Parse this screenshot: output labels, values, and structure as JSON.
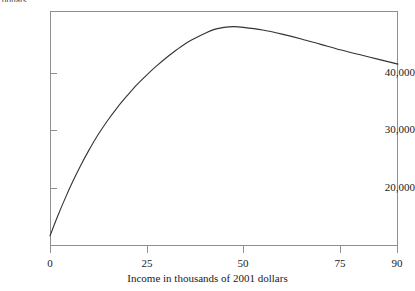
{
  "chart_data": {
    "type": "line",
    "title": "",
    "subtitle": "",
    "xlabel": "Income in thousands of 2001 dollars",
    "ylabel": "dollars",
    "ylabel_clipped": "dollars",
    "xlim": [
      0,
      90
    ],
    "ylim": [
      11000,
      45500
    ],
    "grid": false,
    "legend": null,
    "xticks": [
      0,
      25,
      50,
      75,
      90
    ],
    "xtick_labels": [
      "0",
      "25",
      "50",
      "75",
      "90"
    ],
    "yticks": [
      20000,
      30000,
      40000
    ],
    "ytick_labels": [
      "20,000",
      "30,000",
      "40,000"
    ],
    "line_color": "#333333",
    "line_width": 1,
    "series": [
      {
        "name": "expected value",
        "x": [
          0,
          2,
          4,
          6,
          8,
          10,
          12.5,
          15,
          17.5,
          20,
          22.5,
          25,
          27.5,
          30,
          32.5,
          35,
          37.5,
          40,
          42.5,
          45,
          47.5,
          50,
          55,
          60,
          65,
          70,
          75,
          80,
          85,
          90
        ],
        "values": [
          12500,
          15400,
          18100,
          20600,
          22900,
          25000,
          27400,
          29500,
          31400,
          33100,
          34700,
          36100,
          37400,
          38600,
          39700,
          40700,
          41500,
          42200,
          42800,
          43100,
          43200,
          43100,
          42700,
          42100,
          41400,
          40600,
          39800,
          39100,
          38400,
          37700
        ]
      }
    ],
    "annotations": []
  },
  "axes": {
    "x_axis_name": "income-axis",
    "y_axis_name": "dollars-axis"
  }
}
